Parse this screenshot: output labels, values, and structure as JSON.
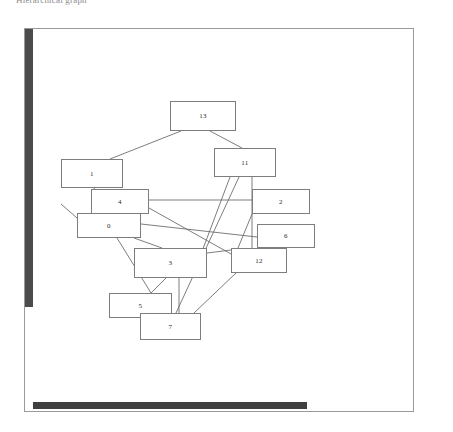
{
  "caption": "Hierarchical graph",
  "figure": {
    "frame": {
      "x": 24,
      "y": 28,
      "w": 390,
      "h": 384,
      "border_color": "#9a9a9a"
    },
    "left_scroll_bar": {
      "x": 25,
      "y": 29,
      "w": 8,
      "h": 278,
      "color": "#4b4b4b"
    },
    "bottom_scroll_bar": {
      "x": 33,
      "y": 402,
      "w": 274,
      "h": 7,
      "color": "#3f3f3f"
    },
    "node_border_color": "#7d7d7d",
    "edge_color": "#6e6e6e",
    "background": "#ffffff"
  },
  "chart_data": {
    "type": "diagram",
    "title": "Hierarchical graph",
    "xlabel": "",
    "ylabel": "",
    "nodes": [
      {
        "id": "13",
        "label": "13",
        "x": 146,
        "y": 73,
        "w": 66,
        "h": 30
      },
      {
        "id": "11",
        "label": "11",
        "x": 190,
        "y": 120,
        "w": 62,
        "h": 29
      },
      {
        "id": "1",
        "label": "1",
        "x": 37,
        "y": 131,
        "w": 62,
        "h": 29
      },
      {
        "id": "4",
        "label": "4",
        "x": 67,
        "y": 161,
        "w": 58,
        "h": 25
      },
      {
        "id": "2",
        "label": "2",
        "x": 228,
        "y": 161,
        "w": 58,
        "h": 25
      },
      {
        "id": "0",
        "label": "0",
        "x": 53,
        "y": 185,
        "w": 64,
        "h": 25
      },
      {
        "id": "6",
        "label": "6",
        "x": 233,
        "y": 196,
        "w": 58,
        "h": 24
      },
      {
        "id": "3",
        "label": "3",
        "x": 110,
        "y": 220,
        "w": 73,
        "h": 30
      },
      {
        "id": "12",
        "label": "12",
        "x": 207,
        "y": 220,
        "w": 56,
        "h": 25
      },
      {
        "id": "5",
        "label": "5",
        "x": 85,
        "y": 265,
        "w": 63,
        "h": 25
      },
      {
        "id": "7",
        "label": "7",
        "x": 116,
        "y": 285,
        "w": 61,
        "h": 27
      }
    ],
    "edges": [
      {
        "from": "13",
        "to": "1",
        "x1": 157,
        "y1": 103,
        "x2": 86,
        "y2": 131
      },
      {
        "from": "13",
        "to": "11",
        "x1": 186,
        "y1": 103,
        "x2": 218,
        "y2": 120
      },
      {
        "from": "11",
        "to": "7",
        "x1": 215,
        "y1": 149,
        "x2": 152,
        "y2": 285
      },
      {
        "from": "11",
        "to": "12",
        "x1": 228,
        "y1": 149,
        "x2": 228,
        "y2": 220
      },
      {
        "from": "11",
        "to": "3",
        "x1": 206,
        "y1": 149,
        "x2": 168,
        "y2": 250
      },
      {
        "from": "1",
        "to": "4",
        "x1": 70,
        "y1": 160,
        "x2": 73,
        "y2": 166
      },
      {
        "from": "4",
        "to": "2",
        "x1": 125,
        "y1": 172,
        "x2": 228,
        "y2": 172
      },
      {
        "from": "4",
        "to": "0",
        "x1": 90,
        "y1": 186,
        "x2": 90,
        "y2": 188
      },
      {
        "from": "0",
        "to": "6",
        "x1": 117,
        "y1": 196,
        "x2": 233,
        "y2": 209
      },
      {
        "from": "0",
        "to": "3",
        "x1": 110,
        "y1": 210,
        "x2": 138,
        "y2": 220
      },
      {
        "from": "0",
        "to": "5",
        "x1": 93,
        "y1": 210,
        "x2": 127,
        "y2": 265
      },
      {
        "from": "1",
        "to": "0",
        "x1": 37,
        "y1": 176,
        "x2": 53,
        "y2": 190
      },
      {
        "from": "3",
        "to": "5",
        "x1": 142,
        "y1": 250,
        "x2": 127,
        "y2": 265
      },
      {
        "from": "3",
        "to": "7",
        "x1": 155,
        "y1": 250,
        "x2": 155,
        "y2": 285
      },
      {
        "from": "12",
        "to": "7",
        "x1": 212,
        "y1": 245,
        "x2": 170,
        "y2": 285
      },
      {
        "from": "3",
        "to": "12",
        "x1": 183,
        "y1": 225,
        "x2": 207,
        "y2": 222
      },
      {
        "from": "6",
        "to": "12",
        "x1": 262,
        "y1": 220,
        "x2": 262,
        "y2": 220
      },
      {
        "from": "5",
        "to": "7",
        "x1": 121,
        "y1": 290,
        "x2": 121,
        "y2": 290
      },
      {
        "from": "2",
        "to": "12",
        "x1": 228,
        "y1": 186,
        "x2": 214,
        "y2": 220
      },
      {
        "from": "4",
        "to": "12",
        "x1": 125,
        "y1": 180,
        "x2": 207,
        "y2": 226
      }
    ]
  }
}
